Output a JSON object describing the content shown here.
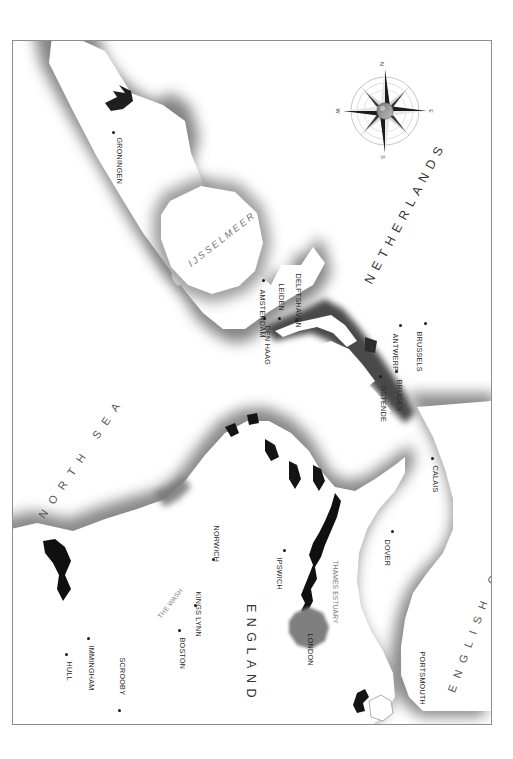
{
  "map": {
    "orientation_note": "north-up map rendered rotated 90 degrees clockwise on the page",
    "frame": {
      "border_color": "#8d8d8d",
      "background": "#ffffff"
    },
    "palette": {
      "land_outline": "#9a9a9a",
      "sea_shade": "#6e6e6e",
      "river_ink": "#111111",
      "city_dot": "#1b1b1b",
      "label_text": "#2a2a2a",
      "water_label": "#6f6f6f"
    },
    "countries": [
      {
        "name": "NETHERLANDS"
      },
      {
        "name": "ENGLAND"
      }
    ],
    "seas": [
      {
        "name": "NORTH SEA"
      },
      {
        "name": "ENGLISH CHANNEL"
      }
    ],
    "water_features": [
      {
        "name": "IJSSELMEER"
      },
      {
        "name": "THE WASH"
      },
      {
        "name": "THAMES ESTUARY"
      }
    ],
    "cities": [
      {
        "name": "GRONINGEN"
      },
      {
        "name": "AMSTERDAM"
      },
      {
        "name": "LEIDEN"
      },
      {
        "name": "DEN HAAG"
      },
      {
        "name": "DELFTSHAVEN"
      },
      {
        "name": "ANTWERP"
      },
      {
        "name": "BRUSSELS"
      },
      {
        "name": "BRUGES"
      },
      {
        "name": "OSTENDE"
      },
      {
        "name": "CALAIS"
      },
      {
        "name": "HULL"
      },
      {
        "name": "IMMINGHAM"
      },
      {
        "name": "SCROOBY"
      },
      {
        "name": "BOSTON"
      },
      {
        "name": "KINGS LYNN"
      },
      {
        "name": "NORWICH"
      },
      {
        "name": "IPSWICH"
      },
      {
        "name": "LONDON"
      },
      {
        "name": "DOVER"
      },
      {
        "name": "PORTSMOUTH"
      }
    ],
    "compass": {
      "north": "N",
      "east": "E",
      "south": "S",
      "west": "W"
    }
  }
}
